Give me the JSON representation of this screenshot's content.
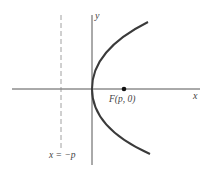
{
  "diagram": {
    "type": "parabola",
    "equation": "y^2 = 4px",
    "colors": {
      "axis": "#555555",
      "curve": "#3a3a3a",
      "directrix": "#888888",
      "text": "#444444",
      "focus": "#111111"
    },
    "labels": {
      "x_axis": "x",
      "y_axis": "y",
      "focus": "F(p, 0)",
      "directrix": "x = −p"
    }
  }
}
